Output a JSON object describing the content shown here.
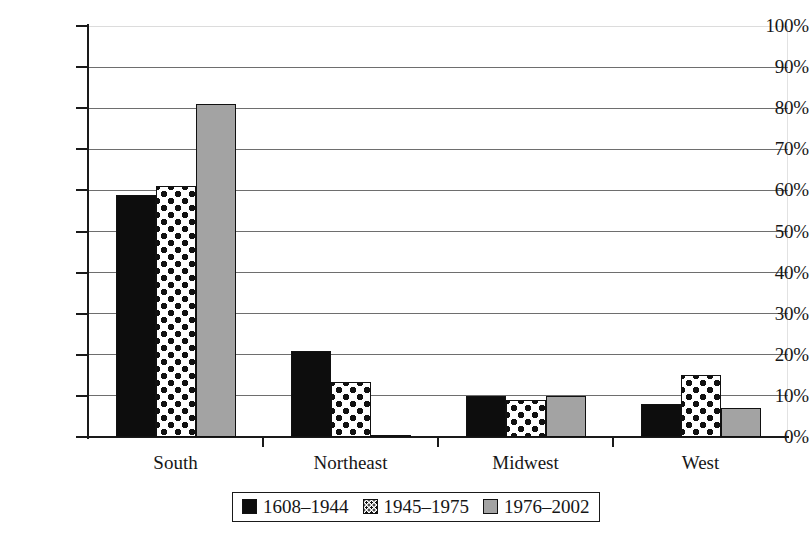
{
  "chart_data": {
    "type": "bar",
    "title": "",
    "subtitle": "",
    "xlabel": "",
    "ylabel": "",
    "ylim": [
      0,
      100
    ],
    "y_unit": "%",
    "grid": true,
    "legend_position": "bottom-center",
    "orientation": "vertical",
    "grouping": "grouped",
    "categories": [
      "South",
      "Northeast",
      "Midwest",
      "West"
    ],
    "y_ticks": [
      "0%",
      "10%",
      "20%",
      "30%",
      "40%",
      "50%",
      "60%",
      "70%",
      "80%",
      "90%",
      "100%"
    ],
    "y_tick_values": [
      0,
      10,
      20,
      30,
      40,
      50,
      60,
      70,
      80,
      90,
      100
    ],
    "series": [
      {
        "name": "1608–1944",
        "fill": "solid-black",
        "color": "#0d0d0d",
        "values": [
          59,
          21,
          10,
          8
        ]
      },
      {
        "name": "1945–1975",
        "fill": "dots",
        "color": "#ffffff",
        "values": [
          61,
          13.5,
          9,
          15
        ]
      },
      {
        "name": "1976–2002",
        "fill": "gray",
        "color": "#a3a3a3",
        "values": [
          81,
          0.3,
          10,
          7
        ]
      }
    ]
  },
  "axis": {
    "y_labels": [
      "100%",
      "90%",
      "80%",
      "70%",
      "60%",
      "50%",
      "40%",
      "30%",
      "20%",
      "10%",
      "0%"
    ],
    "x_labels": [
      "South",
      "Northeast",
      "Midwest",
      "West"
    ]
  },
  "legend": {
    "items": [
      {
        "label": "1608–1944",
        "fill": "solid-black"
      },
      {
        "label": "1945–1975",
        "fill": "dots"
      },
      {
        "label": "1976–2002",
        "fill": "gray"
      }
    ]
  },
  "colors": {
    "series_1": "#0d0d0d",
    "series_2": "#ffffff",
    "series_3": "#a3a3a3",
    "axis": "#1a1a1a",
    "gridline": "#6e6e6e",
    "background": "#ffffff"
  }
}
